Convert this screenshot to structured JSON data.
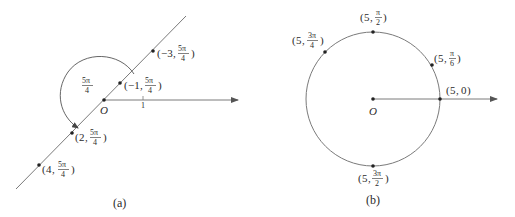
{
  "colors": {
    "line": "#7a7a7a",
    "point": "#222222",
    "text": "#2b2b2b"
  },
  "panel_a": {
    "caption": "(a)",
    "origin_label": "O",
    "tick_label": "1",
    "angle_label": {
      "num": "5π",
      "den": "4"
    },
    "points": [
      {
        "r": "−3",
        "num": "5π",
        "den": "4"
      },
      {
        "r": "−1",
        "num": "5π",
        "den": "4"
      },
      {
        "r": "2",
        "num": "5π",
        "den": "4"
      },
      {
        "r": "4",
        "num": "5π",
        "den": "4"
      }
    ]
  },
  "panel_b": {
    "caption": "(b)",
    "origin_label": "O",
    "points": [
      {
        "r": "5",
        "theta": "0"
      },
      {
        "r": "5",
        "num": "π",
        "den": "6"
      },
      {
        "r": "5",
        "num": "π",
        "den": "2"
      },
      {
        "r": "5",
        "num": "3π",
        "den": "4"
      },
      {
        "r": "5",
        "num": "3π",
        "den": "2"
      }
    ]
  }
}
